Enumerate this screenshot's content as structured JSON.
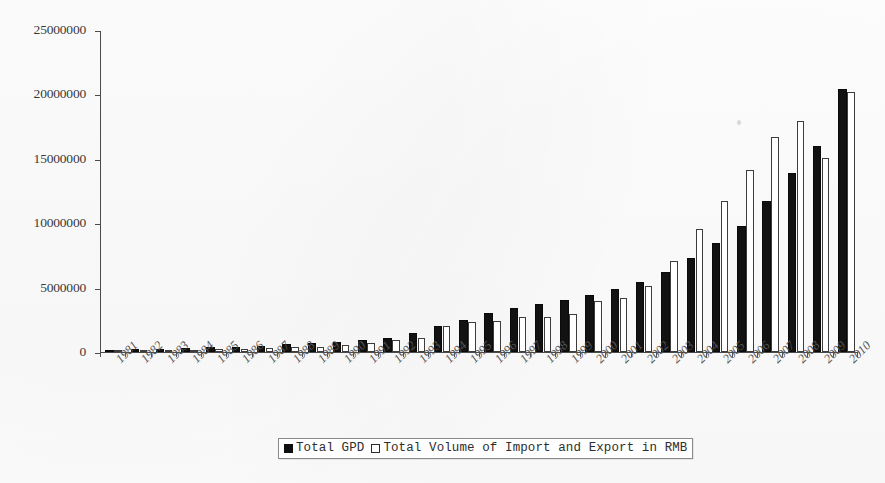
{
  "chart_data": {
    "type": "bar",
    "title": "",
    "xlabel": "",
    "ylabel": "",
    "ylim": [
      0,
      25000000
    ],
    "ytick_labels": [
      "0",
      "5000000",
      "10000000",
      "15000000",
      "20000000",
      "25000000"
    ],
    "yticks": [
      0,
      5000000,
      10000000,
      15000000,
      20000000,
      25000000
    ],
    "grid": false,
    "legend_position": "bottom-center",
    "categories": [
      "1981",
      "1982",
      "1983",
      "1984",
      "1985",
      "1986",
      "1987",
      "1988",
      "1989",
      "1990",
      "1991",
      "1992",
      "1993",
      "1994",
      "1995",
      "1996",
      "1997",
      "1998",
      "1999",
      "2000",
      "2001",
      "2002",
      "2003",
      "2004",
      "2005",
      "2006",
      "2007",
      "2008",
      "2009",
      "2010"
    ],
    "series": [
      {
        "name": "Total GPD",
        "color": "#121212",
        "values": [
          195000,
          213000,
          241000,
          285000,
          360000,
          410000,
          490000,
          630000,
          720000,
          800000,
          920000,
          1120000,
          1500000,
          2000000,
          2500000,
          3000000,
          3400000,
          3700000,
          4000000,
          4400000,
          4900000,
          5400000,
          6200000,
          7300000,
          8500000,
          9800000,
          11700000,
          13900000,
          16000000,
          20400000
        ]
      },
      {
        "name": "Total Volume of Import and Export in RMB",
        "color": "#ffffff",
        "values": [
          73000,
          77000,
          86000,
          120000,
          206000,
          258000,
          308000,
          382000,
          415000,
          556000,
          722000,
          910000,
          1120000,
          2050000,
          2350000,
          2440000,
          2690000,
          2690000,
          2920000,
          3930000,
          4220000,
          5140000,
          7050000,
          9550000,
          11690000,
          14100000,
          16700000,
          17950000,
          15060000,
          20200000
        ]
      }
    ],
    "note": "Bar values read off the vertical axis; second series drawn as open/white bars."
  },
  "legend": {
    "entries": [
      {
        "label": "Total GPD",
        "swatch": "dark"
      },
      {
        "label": "Total Volume of Import and Export in RMB",
        "swatch": "light"
      }
    ]
  },
  "axis": {
    "y_axis_name": "value-axis",
    "x_axis_name": "year-axis"
  }
}
